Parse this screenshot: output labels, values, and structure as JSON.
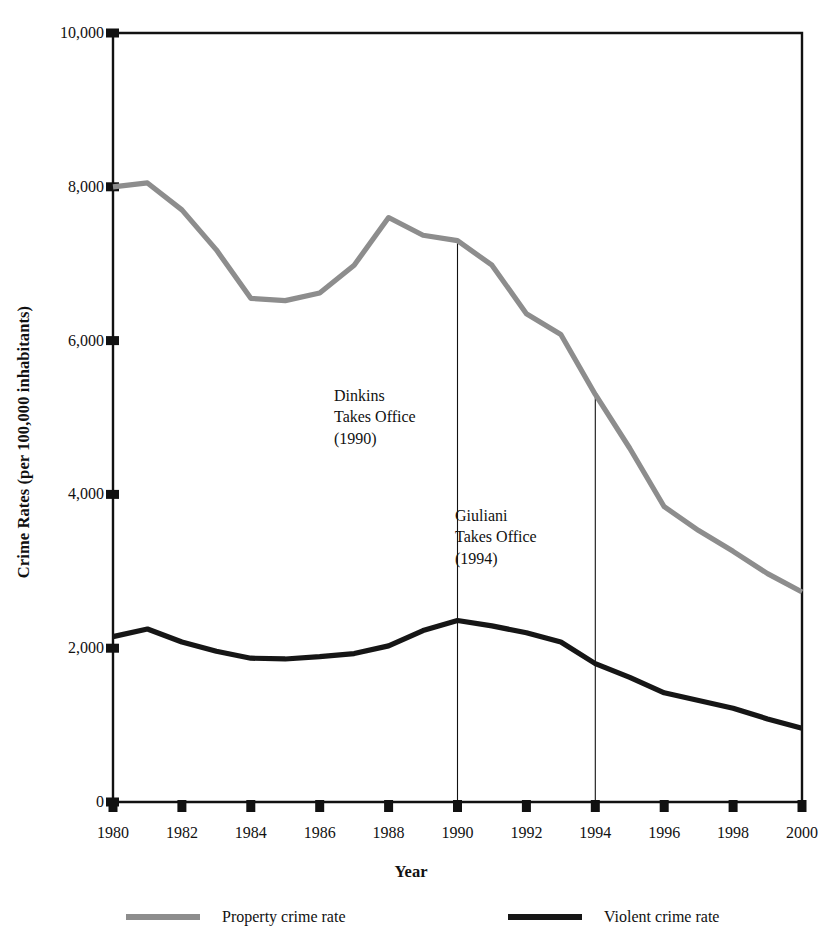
{
  "chart_data": {
    "type": "line",
    "title": "",
    "xlabel": "Year",
    "ylabel": "Crime Rates (per 100,000 inhabitants)",
    "x": [
      1980,
      1981,
      1982,
      1983,
      1984,
      1985,
      1986,
      1987,
      1988,
      1989,
      1990,
      1991,
      1992,
      1993,
      1994,
      1995,
      1996,
      1997,
      1998,
      1999,
      2000
    ],
    "xlim": [
      1980,
      2000
    ],
    "ylim": [
      0,
      10000
    ],
    "xticks": [
      "1980",
      "1982",
      "1984",
      "1986",
      "1988",
      "1990",
      "1992",
      "1994",
      "1996",
      "1998",
      "2000"
    ],
    "xtick_values": [
      1980,
      1982,
      1984,
      1986,
      1988,
      1990,
      1992,
      1994,
      1996,
      1998,
      2000
    ],
    "yticks": [
      "0",
      "2,000",
      "4,000",
      "6,000",
      "8,000",
      "10,000"
    ],
    "ytick_values": [
      0,
      2000,
      4000,
      6000,
      8000,
      10000
    ],
    "grid": false,
    "legend_position": "bottom",
    "series": [
      {
        "name": "Property crime rate",
        "color": "#8d8d8d",
        "values": [
          8000,
          8050,
          7700,
          7180,
          6550,
          6520,
          6620,
          6980,
          7600,
          7370,
          7300,
          6980,
          6350,
          6080,
          5300,
          4600,
          3840,
          3530,
          3260,
          2970,
          2730
        ]
      },
      {
        "name": "Violent crime rate",
        "color": "#161616",
        "values": [
          2150,
          2250,
          2080,
          1960,
          1870,
          1860,
          1890,
          1930,
          2030,
          2230,
          2360,
          2290,
          2200,
          2080,
          1800,
          1620,
          1420,
          1320,
          1220,
          1080,
          960
        ]
      }
    ],
    "annotations": [
      {
        "id": "dinkins",
        "lines": [
          "Dinkins",
          "Takes Office",
          "(1990)"
        ],
        "x": 1990,
        "line_from": 7300,
        "line_to": 0
      },
      {
        "id": "giuliani",
        "lines": [
          "Giuliani",
          "Takes Office",
          "(1994)"
        ],
        "x": 1994,
        "line_from": 5300,
        "line_to": 0
      }
    ]
  },
  "legend": {
    "items": [
      {
        "label": "Property crime rate",
        "color": "#8d8d8d"
      },
      {
        "label": "Violent crime rate",
        "color": "#161616"
      }
    ]
  },
  "axes": {
    "y_title": "Crime Rates (per 100,000 inhabitants)",
    "x_title": "Year"
  }
}
